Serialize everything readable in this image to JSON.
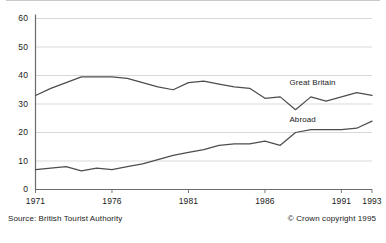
{
  "chart_data": {
    "type": "line",
    "title": "",
    "subtitle": "",
    "xlabel": "",
    "ylabel": "",
    "xlim": [
      1971,
      1993
    ],
    "ylim": [
      0,
      60
    ],
    "grid": true,
    "legend_position": "inline-labels",
    "x": [
      1971,
      1972,
      1973,
      1974,
      1975,
      1976,
      1977,
      1978,
      1979,
      1980,
      1981,
      1982,
      1983,
      1984,
      1985,
      1986,
      1987,
      1988,
      1989,
      1990,
      1991,
      1992,
      1993
    ],
    "xticks": [
      1971,
      1976,
      1981,
      1986,
      1991,
      1993
    ],
    "xtick_labels": [
      "1971",
      "1976",
      "1981",
      "1986",
      "1991",
      "1993"
    ],
    "yticks": [
      0,
      10,
      20,
      30,
      40,
      50,
      60
    ],
    "ytick_labels": [
      "0",
      "10",
      "20",
      "30",
      "40",
      "50",
      "60"
    ],
    "series": [
      {
        "name": "Great Britain",
        "color": "#4d4d4d",
        "label_x": 1987.6,
        "label_y": 37.5,
        "values": [
          33,
          35.5,
          37.5,
          39.5,
          39.5,
          39.5,
          39,
          37.5,
          36,
          35,
          37.5,
          38,
          37,
          36,
          35.5,
          32,
          32.5,
          28,
          32.5,
          31,
          32.5,
          34,
          33
        ]
      },
      {
        "name": "Abroad",
        "color": "#4d4d4d",
        "label_x": 1987.6,
        "label_y": 24.5,
        "values": [
          7,
          7.5,
          8,
          6.5,
          7.5,
          7,
          8,
          9,
          10.5,
          12,
          13,
          14,
          15.5,
          16,
          16,
          17,
          15.5,
          20,
          21,
          21,
          21,
          21.5,
          24
        ]
      }
    ]
  },
  "footer": {
    "source": "Source: British Tourist Authority",
    "copyright": "© Crown copyright 1995"
  }
}
